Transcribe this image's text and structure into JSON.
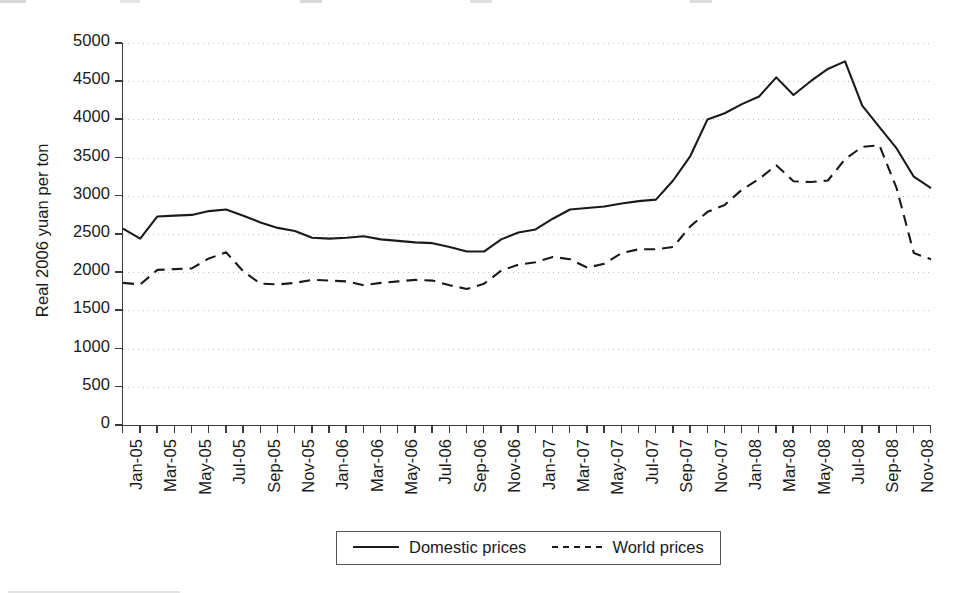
{
  "chart_data": {
    "type": "line",
    "title": "",
    "xlabel": "",
    "ylabel": "Real 2006 yuan per ton",
    "ylim": [
      0,
      5000
    ],
    "ytick_step": 500,
    "yticks": [
      0,
      500,
      1000,
      1500,
      2000,
      2500,
      3000,
      3500,
      4000,
      4500,
      5000
    ],
    "ytick_labels": [
      "0",
      "500",
      "1000",
      "1500",
      "2000",
      "2500",
      "3000",
      "3500",
      "4000",
      "4500",
      "5000"
    ],
    "grid": true,
    "grid_style": "dotted",
    "grid_color": "#b9b9b9",
    "legend_position": "bottom-center",
    "x": [
      "Jan-05",
      "Feb-05",
      "Mar-05",
      "Apr-05",
      "May-05",
      "Jun-05",
      "Jul-05",
      "Aug-05",
      "Sep-05",
      "Oct-05",
      "Nov-05",
      "Dec-05",
      "Jan-06",
      "Feb-06",
      "Mar-06",
      "Apr-06",
      "May-06",
      "Jun-06",
      "Jul-06",
      "Aug-06",
      "Sep-06",
      "Oct-06",
      "Nov-06",
      "Dec-06",
      "Jan-07",
      "Feb-07",
      "Mar-07",
      "Apr-07",
      "May-07",
      "Jun-07",
      "Jul-07",
      "Aug-07",
      "Sep-07",
      "Oct-07",
      "Nov-07",
      "Dec-07",
      "Jan-08",
      "Feb-08",
      "Mar-08",
      "Apr-08",
      "May-08",
      "Jun-08",
      "Jul-08",
      "Aug-08",
      "Sep-08",
      "Oct-08",
      "Nov-08",
      "Dec-08"
    ],
    "xtick_labels_shown": [
      "Jan-05",
      "Mar-05",
      "May-05",
      "Jul-05",
      "Sep-05",
      "Nov-05",
      "Jan-06",
      "Mar-06",
      "May-06",
      "Jul-06",
      "Sep-06",
      "Nov-06",
      "Jan-07",
      "Mar-07",
      "May-07",
      "Jul-07",
      "Sep-07",
      "Nov-07",
      "Jan-08",
      "Mar-08",
      "May-08",
      "Jul-08",
      "Sep-08",
      "Nov-08"
    ],
    "categories": [
      "Jan-05",
      "Feb-05",
      "Mar-05",
      "Apr-05",
      "May-05",
      "Jun-05",
      "Jul-05",
      "Aug-05",
      "Sep-05",
      "Oct-05",
      "Nov-05",
      "Dec-05",
      "Jan-06",
      "Feb-06",
      "Mar-06",
      "Apr-06",
      "May-06",
      "Jun-06",
      "Jul-06",
      "Aug-06",
      "Sep-06",
      "Oct-06",
      "Nov-06",
      "Dec-06",
      "Jan-07",
      "Feb-07",
      "Mar-07",
      "Apr-07",
      "May-07",
      "Jun-07",
      "Jul-07",
      "Aug-07",
      "Sep-07",
      "Oct-07",
      "Nov-07",
      "Dec-07",
      "Jan-08",
      "Feb-08",
      "Mar-08",
      "Apr-08",
      "May-08",
      "Jun-08",
      "Jul-08",
      "Aug-08",
      "Sep-08",
      "Oct-08",
      "Nov-08",
      "Dec-08"
    ],
    "series": [
      {
        "name": "Domestic prices",
        "style": "solid",
        "color": "#1a1a1a",
        "values": [
          2570,
          2440,
          2730,
          2740,
          2750,
          2800,
          2820,
          2740,
          2650,
          2580,
          2540,
          2450,
          2440,
          2450,
          2470,
          2430,
          2410,
          2390,
          2380,
          2330,
          2270,
          2270,
          2430,
          2520,
          2560,
          2700,
          2820,
          2840,
          2860,
          2900,
          2930,
          2950,
          3200,
          3520,
          4000,
          4080,
          4200,
          4300,
          4550,
          4320,
          4500,
          4660,
          4760,
          4180,
          3900,
          3620,
          3250,
          3100
        ]
      },
      {
        "name": "World prices",
        "style": "dashed",
        "color": "#1a1a1a",
        "values": [
          1860,
          1840,
          2030,
          2040,
          2050,
          2180,
          2260,
          2010,
          1850,
          1840,
          1860,
          1900,
          1890,
          1880,
          1830,
          1860,
          1880,
          1900,
          1890,
          1830,
          1780,
          1850,
          2020,
          2100,
          2130,
          2200,
          2170,
          2060,
          2110,
          2250,
          2300,
          2300,
          2330,
          2600,
          2790,
          2880,
          3080,
          3220,
          3400,
          3190,
          3180,
          3200,
          3480,
          3640,
          3660,
          3100,
          2250,
          2170
        ]
      }
    ]
  },
  "legend": {
    "entries": [
      {
        "label": "Domestic prices",
        "style": "solid"
      },
      {
        "label": "World prices",
        "style": "dashed"
      }
    ]
  }
}
